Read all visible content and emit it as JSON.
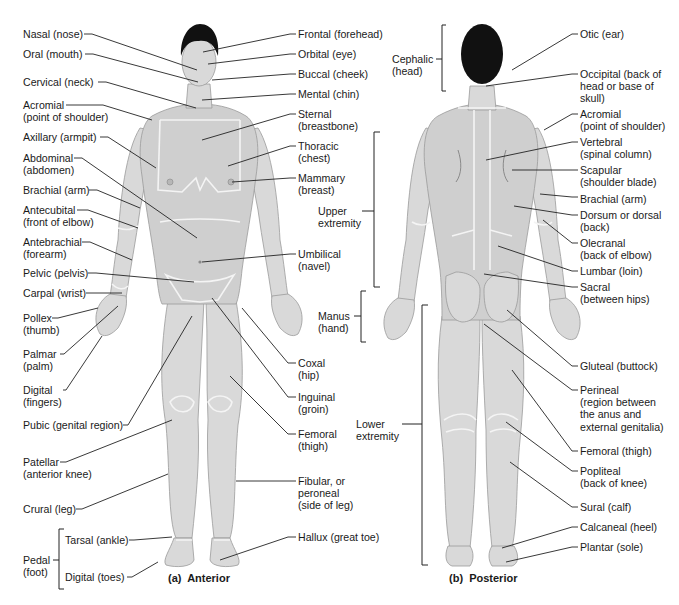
{
  "figure": {
    "captions": {
      "anterior": "(a)  Anterior",
      "posterior": "(b)  Posterior"
    },
    "anterior_left_labels": [
      {
        "id": "nasal",
        "text": "Nasal (nose)",
        "x": 23,
        "y": 28
      },
      {
        "id": "oral",
        "text": "Oral (mouth)",
        "x": 23,
        "y": 48
      },
      {
        "id": "cervical",
        "text": "Cervical (neck)",
        "x": 23,
        "y": 76
      },
      {
        "id": "acromial",
        "text": "Acromial\n(point of shoulder)",
        "x": 23,
        "y": 99
      },
      {
        "id": "axillary",
        "text": "Axillary (armpit)",
        "x": 23,
        "y": 131
      },
      {
        "id": "abdominal",
        "text": "Abdominal\n(abdomen)",
        "x": 23,
        "y": 152
      },
      {
        "id": "brachial",
        "text": "Brachial (arm)",
        "x": 23,
        "y": 184
      },
      {
        "id": "antecubital",
        "text": "Antecubital\n(front of elbow)",
        "x": 23,
        "y": 204
      },
      {
        "id": "antebrachial",
        "text": "Antebrachial\n(forearm)",
        "x": 23,
        "y": 236
      },
      {
        "id": "pelvic",
        "text": "Pelvic (pelvis)",
        "x": 23,
        "y": 267
      },
      {
        "id": "carpal",
        "text": "Carpal (wrist)",
        "x": 23,
        "y": 287
      },
      {
        "id": "pollex",
        "text": "Pollex\n(thumb)",
        "x": 23,
        "y": 312
      },
      {
        "id": "palmar",
        "text": "Palmar\n(palm)",
        "x": 23,
        "y": 348
      },
      {
        "id": "digital_fingers",
        "text": "Digital\n(fingers)",
        "x": 23,
        "y": 384
      },
      {
        "id": "pubic",
        "text": "Pubic (genital region)",
        "x": 23,
        "y": 419
      },
      {
        "id": "patellar",
        "text": "Patellar\n(anterior knee)",
        "x": 23,
        "y": 456
      },
      {
        "id": "crural",
        "text": "Crural (leg)",
        "x": 23,
        "y": 503
      },
      {
        "id": "tarsal",
        "text": "Tarsal (ankle)",
        "x": 65,
        "y": 534
      },
      {
        "id": "pedal",
        "text": "Pedal\n(foot)",
        "x": 23,
        "y": 554
      },
      {
        "id": "digital_toes",
        "text": "Digital (toes)",
        "x": 65,
        "y": 571
      }
    ],
    "anterior_right_labels": [
      {
        "id": "frontal",
        "text": "Frontal (forehead)",
        "x": 298,
        "y": 28
      },
      {
        "id": "orbital",
        "text": "Orbital (eye)",
        "x": 298,
        "y": 48
      },
      {
        "id": "buccal",
        "text": "Buccal (cheek)",
        "x": 298,
        "y": 68
      },
      {
        "id": "mental",
        "text": "Mental (chin)",
        "x": 298,
        "y": 88
      },
      {
        "id": "sternal",
        "text": "Sternal\n(breastbone)",
        "x": 298,
        "y": 108
      },
      {
        "id": "thoracic",
        "text": "Thoracic\n(chest)",
        "x": 298,
        "y": 140
      },
      {
        "id": "mammary",
        "text": "Mammary\n(breast)",
        "x": 298,
        "y": 172
      },
      {
        "id": "umbilical",
        "text": "Umbilical\n(navel)",
        "x": 298,
        "y": 248
      },
      {
        "id": "coxal",
        "text": "Coxal\n(hip)",
        "x": 298,
        "y": 357
      },
      {
        "id": "inguinal",
        "text": "Inguinal\n(groin)",
        "x": 298,
        "y": 391
      },
      {
        "id": "femoral_a",
        "text": "Femoral\n(thigh)",
        "x": 298,
        "y": 428
      },
      {
        "id": "fibular",
        "text": "Fibular, or\nperoneal\n(side of leg)",
        "x": 298,
        "y": 475
      },
      {
        "id": "hallux",
        "text": "Hallux (great toe)",
        "x": 298,
        "y": 531
      }
    ],
    "posterior_left_labels": [
      {
        "id": "cephalic",
        "text": "Cephalic\n(head)",
        "x": 392,
        "y": 53
      },
      {
        "id": "upper_extremity",
        "text": "Upper\nextremity",
        "x": 318,
        "y": 205
      },
      {
        "id": "manus",
        "text": "Manus\n(hand)",
        "x": 318,
        "y": 310
      },
      {
        "id": "lower_extremity",
        "text": "Lower\nextremity",
        "x": 356,
        "y": 418
      }
    ],
    "posterior_right_labels": [
      {
        "id": "otic",
        "text": "Otic (ear)",
        "x": 580,
        "y": 28
      },
      {
        "id": "occipital",
        "text": "Occipital (back of\nhead or base of\nskull)",
        "x": 580,
        "y": 68
      },
      {
        "id": "acromial_p",
        "text": "Acromial\n(point of shoulder)",
        "x": 580,
        "y": 108
      },
      {
        "id": "vertebral",
        "text": "Vertebral\n(spinal column)",
        "x": 580,
        "y": 136
      },
      {
        "id": "scapular",
        "text": "Scapular\n(shoulder blade)",
        "x": 580,
        "y": 164
      },
      {
        "id": "brachial_p",
        "text": "Brachial (arm)",
        "x": 580,
        "y": 193
      },
      {
        "id": "dorsum",
        "text": "Dorsum or dorsal\n(back)",
        "x": 580,
        "y": 209
      },
      {
        "id": "olecranal",
        "text": "Olecranal\n(back of elbow)",
        "x": 580,
        "y": 237
      },
      {
        "id": "lumbar",
        "text": "Lumbar (loin)",
        "x": 580,
        "y": 265
      },
      {
        "id": "sacral",
        "text": "Sacral\n(between hips)",
        "x": 580,
        "y": 281
      },
      {
        "id": "gluteal",
        "text": "Gluteal (buttock)",
        "x": 580,
        "y": 360
      },
      {
        "id": "perineal",
        "text": "Perineal\n(region between\nthe anus and\nexternal genitalia)",
        "x": 580,
        "y": 384
      },
      {
        "id": "femoral_p",
        "text": "Femoral (thigh)",
        "x": 580,
        "y": 445
      },
      {
        "id": "popliteal",
        "text": "Popliteal\n(back of knee)",
        "x": 580,
        "y": 465
      },
      {
        "id": "sural",
        "text": "Sural (calf)",
        "x": 580,
        "y": 501
      },
      {
        "id": "calcaneal",
        "text": "Calcaneal (heel)",
        "x": 580,
        "y": 521
      },
      {
        "id": "plantar",
        "text": "Plantar (sole)",
        "x": 580,
        "y": 541
      }
    ]
  }
}
